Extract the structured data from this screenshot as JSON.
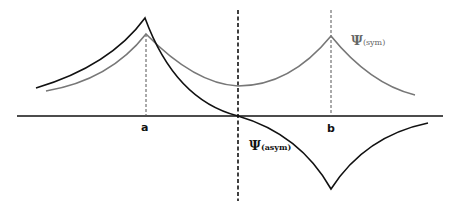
{
  "diagram": {
    "title": "",
    "colors": {
      "axis": "#111111",
      "symmetric_curve": "#777777",
      "antisymmetric_curve": "#111111",
      "dashed_guides": "#555555",
      "center_dashed": "#111111"
    },
    "axis_labels": {
      "a": "a",
      "b": "b"
    },
    "curve_labels": {
      "sym": {
        "symbol": "Ψ",
        "subscript": "(sym)"
      },
      "asym": {
        "symbol": "Ψ",
        "subscript": "(asym)"
      }
    }
  }
}
